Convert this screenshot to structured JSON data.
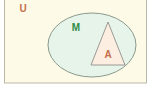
{
  "diagram": {
    "type": "euler-venn-diagram",
    "canvas": {
      "width": 153,
      "height": 96,
      "background": "#ffffff"
    },
    "universe": {
      "label": "U",
      "shape": "rectangle",
      "fill": "#fdfbe7",
      "stroke": "#b9b9a8",
      "label_color": "#c4704a",
      "label_x": 23,
      "label_y": 12,
      "x": 4,
      "y": -2,
      "width": 143,
      "height": 85
    },
    "set_m": {
      "label": "M",
      "shape": "ellipse",
      "fill": "#e7f4e9",
      "stroke": "#8a9a8c",
      "label_color": "#2f8b46",
      "label_x": 76,
      "label_y": 31,
      "cx": 92,
      "cy": 45,
      "rx": 44,
      "ry": 32
    },
    "set_a": {
      "label": "A",
      "shape": "triangle",
      "fill": "#fdeee2",
      "stroke": "#9a9a93",
      "label_color": "#c4704a",
      "label_x": 108,
      "label_y": 58,
      "apex_x": 108,
      "apex_y": 22,
      "base_left_x": 91,
      "base_right_x": 125,
      "base_y": 65
    },
    "relation": "A is a subset of M, and M is a subset of U"
  }
}
